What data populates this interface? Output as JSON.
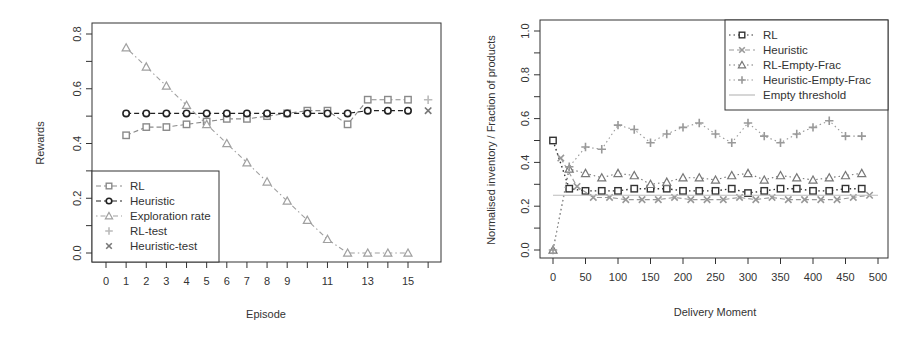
{
  "chart_data": [
    {
      "type": "line",
      "title": "",
      "xlabel": "Episode",
      "ylabel": "Rewards",
      "xlim": [
        0,
        16
      ],
      "ylim": [
        0.0,
        0.8
      ],
      "x_tick_labels": [
        "0",
        "1",
        "2",
        "3",
        "4",
        "5",
        "6",
        "7",
        "8",
        "9",
        "11",
        "13",
        "15"
      ],
      "y_tick_labels": [
        "0.0",
        "0.2",
        "0.4",
        "0.6",
        "0.8"
      ],
      "grid": false,
      "legend_position": "bottom-left",
      "x": [
        1,
        2,
        3,
        4,
        5,
        6,
        7,
        8,
        9,
        10,
        11,
        12,
        13,
        14,
        15
      ],
      "series": [
        {
          "name": "RL",
          "marker": "square",
          "line": "dashed",
          "color": "#8a8a8a",
          "values": [
            0.43,
            0.46,
            0.46,
            0.47,
            0.48,
            0.49,
            0.49,
            0.5,
            0.51,
            0.52,
            0.52,
            0.47,
            0.56,
            0.56,
            0.56
          ]
        },
        {
          "name": "Heuristic",
          "marker": "circle",
          "line": "dashed",
          "color": "#222222",
          "values": [
            0.51,
            0.51,
            0.51,
            0.51,
            0.51,
            0.51,
            0.51,
            0.51,
            0.51,
            0.51,
            0.51,
            0.51,
            0.52,
            0.52,
            0.52
          ]
        },
        {
          "name": "Exploration rate",
          "marker": "triangle",
          "line": "dotdash",
          "color": "#a0a0a0",
          "values": [
            0.75,
            0.68,
            0.61,
            0.54,
            0.47,
            0.4,
            0.33,
            0.26,
            0.19,
            0.12,
            0.05,
            0.0,
            0.0,
            0.0,
            0.0
          ]
        },
        {
          "name": "RL-test",
          "marker": "plus",
          "line": "none",
          "color": "#bbbbbb",
          "x": [
            16
          ],
          "values": [
            0.56
          ]
        },
        {
          "name": "Heuristic-test",
          "marker": "x",
          "line": "none",
          "color": "#777777",
          "x": [
            16
          ],
          "values": [
            0.52
          ]
        }
      ]
    },
    {
      "type": "line",
      "title": "",
      "xlabel": "Delivery Moment",
      "ylabel": "Normalised inventory / Fraction of products",
      "xlim": [
        0,
        500
      ],
      "ylim": [
        0.0,
        1.0
      ],
      "x_tick_labels": [
        "0",
        "50",
        "100",
        "150",
        "200",
        "250",
        "300",
        "350",
        "400",
        "450",
        "500"
      ],
      "y_tick_labels": [
        "0.0",
        "0.2",
        "0.4",
        "0.6",
        "0.8",
        "1.0"
      ],
      "grid": false,
      "legend_position": "top-right",
      "series": [
        {
          "name": "RL",
          "marker": "square",
          "line": "dotted",
          "color": "#333333",
          "x": [
            0,
            25,
            50,
            75,
            100,
            125,
            150,
            175,
            200,
            225,
            250,
            275,
            300,
            325,
            350,
            375,
            400,
            425,
            450,
            475
          ],
          "values": [
            0.5,
            0.28,
            0.27,
            0.27,
            0.27,
            0.28,
            0.28,
            0.28,
            0.27,
            0.27,
            0.27,
            0.28,
            0.26,
            0.27,
            0.28,
            0.28,
            0.27,
            0.27,
            0.28,
            0.28
          ]
        },
        {
          "name": "Heuristic",
          "marker": "x",
          "line": "dashed",
          "color": "#999999",
          "x": [
            12,
            37,
            62,
            87,
            112,
            137,
            162,
            187,
            212,
            237,
            262,
            287,
            312,
            337,
            362,
            387,
            412,
            437,
            462,
            487
          ],
          "values": [
            0.42,
            0.29,
            0.24,
            0.24,
            0.23,
            0.23,
            0.23,
            0.24,
            0.23,
            0.23,
            0.23,
            0.24,
            0.23,
            0.24,
            0.23,
            0.23,
            0.23,
            0.23,
            0.24,
            0.25
          ]
        },
        {
          "name": "RL-Empty-Frac",
          "marker": "triangle",
          "line": "dotted",
          "color": "#777777",
          "x": [
            0,
            25,
            50,
            75,
            100,
            125,
            150,
            175,
            200,
            225,
            250,
            275,
            300,
            325,
            350,
            375,
            400,
            425,
            450,
            475
          ],
          "values": [
            0.0,
            0.37,
            0.35,
            0.33,
            0.35,
            0.34,
            0.3,
            0.31,
            0.33,
            0.33,
            0.32,
            0.34,
            0.35,
            0.32,
            0.34,
            0.33,
            0.32,
            0.33,
            0.34,
            0.35
          ]
        },
        {
          "name": "Heuristic-Empty-Frac",
          "marker": "plus",
          "line": "dotted",
          "color": "#999999",
          "x": [
            0,
            25,
            50,
            75,
            100,
            125,
            150,
            175,
            200,
            225,
            250,
            275,
            300,
            325,
            350,
            375,
            400,
            425,
            450,
            475
          ],
          "values": [
            0.0,
            0.38,
            0.47,
            0.46,
            0.57,
            0.55,
            0.49,
            0.53,
            0.56,
            0.58,
            0.53,
            0.49,
            0.58,
            0.52,
            0.49,
            0.53,
            0.56,
            0.59,
            0.52,
            0.52
          ]
        },
        {
          "name": "Empty threshold",
          "marker": "none",
          "line": "solid",
          "color": "#bbbbbb",
          "x": [
            0,
            500
          ],
          "values": [
            0.25,
            0.25
          ]
        }
      ]
    }
  ],
  "left_chart": {
    "xlabel": "Episode",
    "ylabel": "Rewards",
    "legend": [
      "RL",
      "Heuristic",
      "Exploration rate",
      "RL-test",
      "Heuristic-test"
    ]
  },
  "right_chart": {
    "xlabel": "Delivery Moment",
    "ylabel": "Normalised inventory / Fraction of products",
    "legend": [
      "RL",
      "Heuristic",
      "RL-Empty-Frac",
      "Heuristic-Empty-Frac",
      "Empty threshold"
    ]
  }
}
